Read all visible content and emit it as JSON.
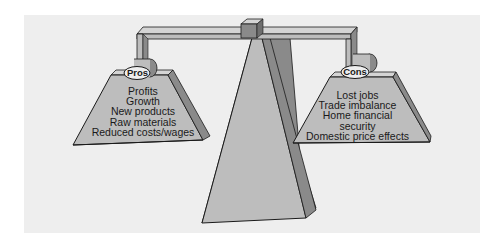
{
  "diagram": {
    "type": "balance-scale",
    "colors": {
      "background": "#ffffff",
      "panel": "#eeeeee",
      "face": "#bdbdbd",
      "side": "#8a8a8a",
      "top": "#d4d4d4",
      "outline": "#1a1a1a"
    },
    "left_pan": {
      "label": "Pros",
      "items": [
        "Profits",
        "Growth",
        "New products",
        "Raw materials",
        "Reduced costs/wages"
      ]
    },
    "right_pan": {
      "label": "Cons",
      "items": [
        "Lost jobs",
        "Trade imbalance",
        "Home financial security",
        "Domestic price effects"
      ]
    }
  }
}
